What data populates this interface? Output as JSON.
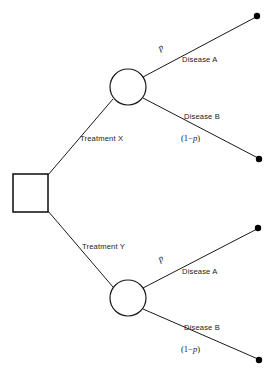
{
  "diagram": {
    "type": "decision-tree",
    "background_color": "#ffffff",
    "line_color": "#1a1a1a",
    "dot_color": "#000000",
    "nodes": {
      "decision": {
        "shape": "square",
        "label": "",
        "x": 13,
        "y": 174,
        "width": 35,
        "height": 38
      },
      "chance_upper": {
        "shape": "circle",
        "label": "",
        "cx": 128,
        "cy": 87,
        "r": 18
      },
      "chance_lower": {
        "shape": "circle",
        "label": "",
        "cx": 128,
        "cy": 298,
        "r": 18
      }
    },
    "branches": {
      "treatment_x": "Treatment X",
      "treatment_y": "Treatment Y",
      "disease_a_upper": "Disease A",
      "disease_b_upper": "Disease B",
      "disease_a_lower": "Disease A",
      "disease_b_lower": "Disease B"
    },
    "probabilities": {
      "p_upper": "p",
      "p_complement_upper_open": "(1−",
      "p_complement_upper_symbol": "p",
      "p_complement_upper_close": ")",
      "p_lower": "p",
      "p_complement_lower_open": "(1−",
      "p_complement_lower_symbol": "p",
      "p_complement_lower_close": ")"
    },
    "terminals": [
      {
        "name": "terminal-a-upper",
        "cx": 257,
        "cy": 16,
        "r": 3.2
      },
      {
        "name": "terminal-b-upper",
        "cx": 259,
        "cy": 159,
        "r": 3.2
      },
      {
        "name": "terminal-a-lower",
        "cx": 258,
        "cy": 228,
        "r": 3.2
      },
      {
        "name": "terminal-b-lower",
        "cx": 259,
        "cy": 360,
        "r": 3.2
      }
    ]
  }
}
